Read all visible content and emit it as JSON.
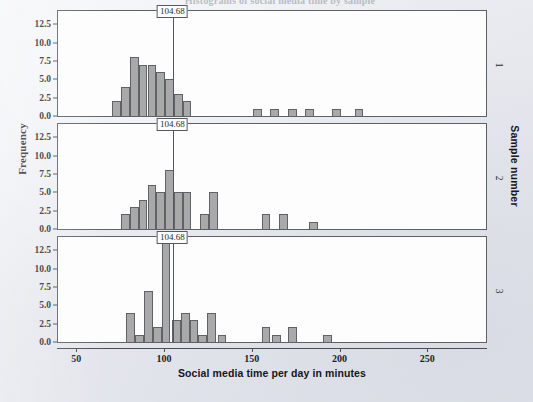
{
  "figure": {
    "cropped_title": "Histograms of social media time by sample",
    "xlabel": "Social media time per day in minutes",
    "ylabel": "Frequency",
    "strip_title": "Sample number",
    "reference_label": "104.68",
    "bar_color": "#a9a9a9",
    "bar_edge_color": "#5f6268",
    "panel_bg": "#fdfdfd",
    "page_bg": "#e9ebef",
    "axis_color": "#4a4d53"
  },
  "axes": {
    "x_ticks": [
      50,
      100,
      150,
      200,
      250
    ],
    "x_tick_labels": [
      "50",
      "100",
      "150",
      "200",
      "250"
    ],
    "xlim": [
      39,
      284
    ],
    "y_ticks": [
      0.0,
      2.5,
      5.0,
      7.5,
      10.0,
      12.5
    ],
    "y_tick_labels": [
      "0.0",
      "2.5",
      "5.0",
      "7.5",
      "10.0",
      "12.5"
    ],
    "ylim": [
      0,
      14.3
    ],
    "grid": false
  },
  "chart_data": {
    "type": "bar",
    "title": "Histograms of social media time by sample",
    "xlabel": "Social media time per day in minutes",
    "ylabel": "Frequency",
    "xlim": [
      39,
      284
    ],
    "ylim": [
      0,
      14.3
    ],
    "bin_width": 5,
    "reference_line": 104.68,
    "legend": "none",
    "panels": [
      {
        "name": "1",
        "strip_label": "1",
        "reference_line": 104.68,
        "bins": [
          {
            "x": 70,
            "value": 2
          },
          {
            "x": 75,
            "value": 4
          },
          {
            "x": 80,
            "value": 8
          },
          {
            "x": 85,
            "value": 7
          },
          {
            "x": 90,
            "value": 7
          },
          {
            "x": 95,
            "value": 6
          },
          {
            "x": 100,
            "value": 5
          },
          {
            "x": 105,
            "value": 3
          },
          {
            "x": 110,
            "value": 2
          },
          {
            "x": 150,
            "value": 1
          },
          {
            "x": 160,
            "value": 1
          },
          {
            "x": 170,
            "value": 1
          },
          {
            "x": 180,
            "value": 1
          },
          {
            "x": 195,
            "value": 1
          },
          {
            "x": 208,
            "value": 1
          }
        ]
      },
      {
        "name": "2",
        "strip_label": "2",
        "reference_line": 104.68,
        "bins": [
          {
            "x": 75,
            "value": 2
          },
          {
            "x": 80,
            "value": 3
          },
          {
            "x": 85,
            "value": 4
          },
          {
            "x": 90,
            "value": 6
          },
          {
            "x": 95,
            "value": 5
          },
          {
            "x": 100,
            "value": 8
          },
          {
            "x": 105,
            "value": 5
          },
          {
            "x": 110,
            "value": 5
          },
          {
            "x": 120,
            "value": 2
          },
          {
            "x": 125,
            "value": 5
          },
          {
            "x": 155,
            "value": 2
          },
          {
            "x": 165,
            "value": 2
          },
          {
            "x": 182,
            "value": 1
          }
        ]
      },
      {
        "name": "3",
        "strip_label": "3",
        "reference_line": 104.68,
        "bins": [
          {
            "x": 78,
            "value": 4
          },
          {
            "x": 83,
            "value": 1
          },
          {
            "x": 88,
            "value": 7
          },
          {
            "x": 93,
            "value": 2
          },
          {
            "x": 98,
            "value": 14
          },
          {
            "x": 104,
            "value": 3
          },
          {
            "x": 109,
            "value": 4
          },
          {
            "x": 114,
            "value": 3
          },
          {
            "x": 119,
            "value": 1
          },
          {
            "x": 124,
            "value": 4
          },
          {
            "x": 130,
            "value": 1
          },
          {
            "x": 155,
            "value": 2
          },
          {
            "x": 161,
            "value": 1
          },
          {
            "x": 170,
            "value": 2
          },
          {
            "x": 190,
            "value": 1
          }
        ]
      }
    ]
  }
}
